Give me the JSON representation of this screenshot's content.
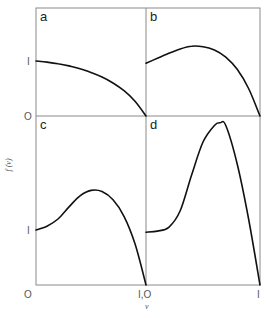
{
  "chart_data": {
    "type": "line",
    "layout": "2x2 panel grid, shared axes",
    "xlabel": "ν",
    "ylabel": "f (ν)",
    "grid": false,
    "legend": null,
    "x_tick_labels": [
      "O",
      "I,O",
      "I"
    ],
    "y_tick_labels": {
      "top_row": [
        "O",
        "I"
      ],
      "bottom_row": [
        "O",
        "I"
      ]
    },
    "panels": [
      {
        "label": "a",
        "xlim": [
          0,
          1
        ],
        "ylim": [
          0,
          2
        ],
        "x": [
          0,
          0.1,
          0.2,
          0.3,
          0.4,
          0.5,
          0.6,
          0.7,
          0.8,
          0.9,
          1.0
        ],
        "y": [
          1.0,
          0.98,
          0.95,
          0.91,
          0.86,
          0.79,
          0.71,
          0.6,
          0.46,
          0.27,
          0.0
        ]
      },
      {
        "label": "b",
        "xlim": [
          0,
          1
        ],
        "ylim": [
          0,
          2
        ],
        "x": [
          0,
          0.1,
          0.2,
          0.3,
          0.4,
          0.5,
          0.6,
          0.7,
          0.8,
          0.9,
          1.0
        ],
        "y": [
          0.96,
          1.05,
          1.14,
          1.22,
          1.27,
          1.26,
          1.2,
          1.07,
          0.85,
          0.5,
          0.0
        ]
      },
      {
        "label": "c",
        "xlim": [
          0,
          1
        ],
        "ylim": [
          0,
          3
        ],
        "x": [
          0,
          0.1,
          0.2,
          0.3,
          0.4,
          0.5,
          0.6,
          0.7,
          0.8,
          0.9,
          1.0
        ],
        "y": [
          1.0,
          1.07,
          1.2,
          1.42,
          1.62,
          1.72,
          1.7,
          1.55,
          1.25,
          0.75,
          0.0
        ]
      },
      {
        "label": "d",
        "xlim": [
          0,
          1
        ],
        "ylim": [
          0,
          3
        ],
        "x": [
          0,
          0.1,
          0.2,
          0.3,
          0.4,
          0.5,
          0.6,
          0.65,
          0.7,
          0.8,
          0.9,
          1.0
        ],
        "y": [
          0.96,
          0.98,
          1.05,
          1.35,
          2.0,
          2.6,
          2.9,
          2.95,
          2.9,
          2.2,
          1.2,
          0.0
        ]
      }
    ]
  },
  "figure": {
    "panel_labels": [
      "a",
      "b",
      "c",
      "d"
    ],
    "y_axis_label": "f (ν)",
    "x_axis_label": "ν",
    "ticks": {
      "top_one": "I",
      "top_zero": "O",
      "bottom_one": "I",
      "bottom_zero": "O",
      "x_mid": "I,O",
      "x_right": "I"
    }
  }
}
